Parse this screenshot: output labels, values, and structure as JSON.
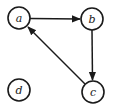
{
  "diagram": {
    "type": "directed-graph",
    "nodes": [
      {
        "id": "a",
        "label": "a",
        "cx": 19,
        "cy": 18,
        "r": 11
      },
      {
        "id": "b",
        "label": "b",
        "cx": 92,
        "cy": 19,
        "r": 11
      },
      {
        "id": "c",
        "label": "c",
        "cx": 93,
        "cy": 92,
        "r": 11
      },
      {
        "id": "d",
        "label": "d",
        "cx": 19,
        "cy": 90,
        "r": 11
      }
    ],
    "edges": [
      {
        "from": "a",
        "to": "b"
      },
      {
        "from": "b",
        "to": "c"
      },
      {
        "from": "c",
        "to": "a"
      }
    ],
    "colors": {
      "stroke": "#1a1a1a",
      "background": "#ffffff"
    }
  }
}
